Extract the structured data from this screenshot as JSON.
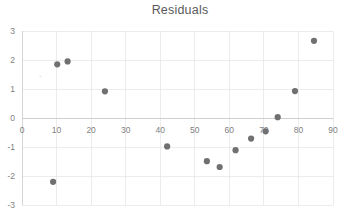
{
  "chart_data": {
    "type": "scatter",
    "title": "Residuals",
    "xlabel": "",
    "ylabel": "",
    "xlim": [
      0,
      90
    ],
    "ylim": [
      -3,
      3
    ],
    "grid": true,
    "legend": "none",
    "xticks": [
      "0",
      "10",
      "20",
      "30",
      "40",
      "50",
      "60",
      "70",
      "80",
      "90"
    ],
    "xtick_values": [
      0,
      10,
      20,
      30,
      40,
      50,
      60,
      70,
      80,
      90
    ],
    "yticks": [
      "3",
      "2",
      "1",
      "0",
      "-1",
      "-2",
      "-3"
    ],
    "ytick_values": [
      3,
      2,
      1,
      0,
      -1,
      -2,
      -3
    ],
    "series": [
      {
        "name": "Residuals",
        "color": "#707070",
        "marker": "circle",
        "points": [
          {
            "x": 9.0,
            "y": -2.2
          },
          {
            "x": 10.2,
            "y": 1.85
          },
          {
            "x": 13.2,
            "y": 1.95
          },
          {
            "x": 24.0,
            "y": 0.92
          },
          {
            "x": 42.0,
            "y": -0.98
          },
          {
            "x": 53.5,
            "y": -1.49
          },
          {
            "x": 57.2,
            "y": -1.69
          },
          {
            "x": 61.8,
            "y": -1.11
          },
          {
            "x": 66.3,
            "y": -0.71
          },
          {
            "x": 70.5,
            "y": -0.46
          },
          {
            "x": 74.0,
            "y": 0.03
          },
          {
            "x": 79.0,
            "y": 0.93
          },
          {
            "x": 84.5,
            "y": 2.66
          }
        ]
      }
    ]
  },
  "colors": {
    "marker": "#707070",
    "grid": "#e4e4e4",
    "axis": "#d0d0d0",
    "text": "#7f7f7f",
    "title": "#5a5a5a",
    "background": "#ffffff"
  }
}
